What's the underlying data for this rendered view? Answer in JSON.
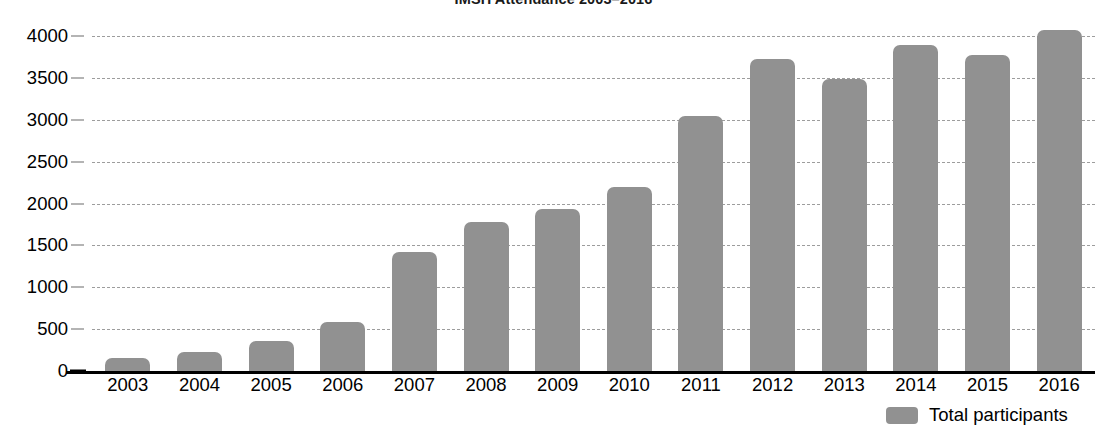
{
  "chart_data": {
    "type": "bar",
    "title": "IMSH Attendance 2003–2016",
    "xlabel": "",
    "ylabel": "",
    "ylim": [
      0,
      4000
    ],
    "ytick_step": 500,
    "yticks": [
      "0",
      "500",
      "1000",
      "1500",
      "2000",
      "2500",
      "3000",
      "3500",
      "4000"
    ],
    "grid": true,
    "legend_position": "bottom-right",
    "legend": [
      "Total participants"
    ],
    "categories": [
      "2003",
      "2004",
      "2005",
      "2006",
      "2007",
      "2008",
      "2009",
      "2010",
      "2011",
      "2012",
      "2013",
      "2014",
      "2015",
      "2016"
    ],
    "series": [
      {
        "name": "Total participants",
        "color": "#919191",
        "values": [
          155,
          230,
          360,
          585,
          1425,
          1780,
          1930,
          2200,
          3050,
          3730,
          3490,
          3890,
          3770,
          4070
        ]
      }
    ]
  },
  "colors": {
    "bar": "#919191",
    "gridline": "#8d8d8d",
    "axis": "#000000",
    "text": "#000000",
    "background": "#ffffff"
  }
}
